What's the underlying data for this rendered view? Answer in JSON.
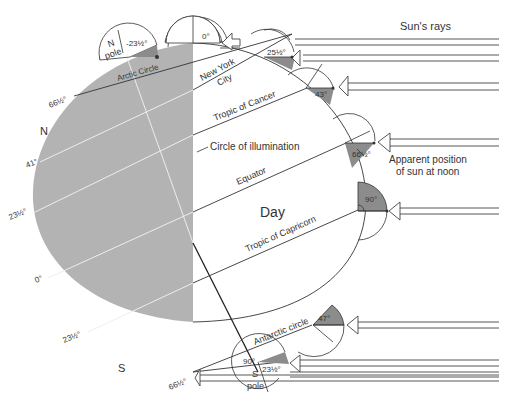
{
  "diagram": {
    "title_rays": "Sun's rays",
    "day_label": "Day",
    "circle_of_illumination": "Circle of illumination",
    "apparent_position": [
      "Apparent position",
      "of sun at noon"
    ],
    "north_label": "N",
    "south_label": "S",
    "n_pole": [
      "N",
      "pole"
    ],
    "s_pole": [
      "S",
      "pole"
    ],
    "latitude_lines": [
      {
        "name": "Arctic Circle",
        "left_label": "66½°"
      },
      {
        "name": "New York City",
        "left_label": "41°"
      },
      {
        "name": "Tropic of Cancer",
        "left_label": "23½°"
      },
      {
        "name": "Equator",
        "left_label": "0°"
      },
      {
        "name": "Tropic of Capricorn",
        "left_label": "23½°"
      },
      {
        "name": "Antarctic circle",
        "left_label": "66½°"
      }
    ],
    "text_labels": {
      "new_york": [
        "New York",
        "City"
      ],
      "tropic_cancer": "Tropic of Cancer",
      "equator": "Equator",
      "tropic_capricorn": "Tropic of Capricorn",
      "arctic": "Arctic Circle",
      "antarctic": "Antarctic circle"
    },
    "noon_angles": [
      {
        "location": "Arctic Circle",
        "angle": "0°"
      },
      {
        "location": "North Pole",
        "angle": "-23½°"
      },
      {
        "location": "New York City",
        "angle": "25½°"
      },
      {
        "location": "Tropic of Cancer",
        "angle": "43°"
      },
      {
        "location": "Equator",
        "angle": "66½°"
      },
      {
        "location": "Tropic of Capricorn",
        "angle": "90°"
      },
      {
        "location": "Antarctic circle",
        "angle": "47°"
      },
      {
        "location": "South Pole",
        "angle": "23½°"
      },
      {
        "location": "Axis",
        "angle": "90°"
      }
    ],
    "left_labels": {
      "lat_66_n": "66½°",
      "lat_41": "41°",
      "lat_23_n": "23½°",
      "lat_0": "0°",
      "lat_23_s": "23½°",
      "lat_66_s": "66½°"
    },
    "colors": {
      "night": "#b3b3b3",
      "shade": "#8c8c8c",
      "line": "#333333"
    }
  }
}
